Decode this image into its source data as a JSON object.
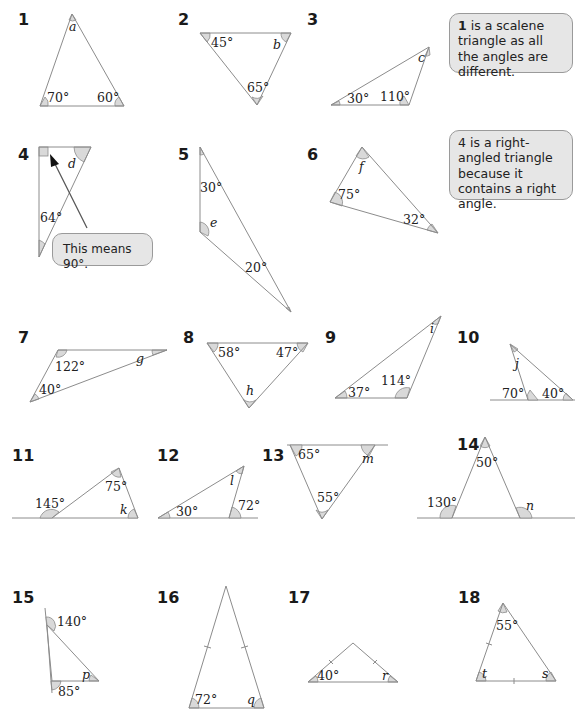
{
  "exercise": {
    "questions": [
      {
        "number": "1",
        "known": [
          "70°",
          "60°"
        ],
        "unknown": "a"
      },
      {
        "number": "2",
        "known": [
          "45°",
          "65°"
        ],
        "unknown": "b"
      },
      {
        "number": "3",
        "known": [
          "30°",
          "110°"
        ],
        "unknown": "c"
      },
      {
        "number": "4",
        "known": [
          "64°"
        ],
        "unknown": "d",
        "right_angle": true
      },
      {
        "number": "5",
        "known": [
          "30°",
          "20°"
        ],
        "unknown": "e"
      },
      {
        "number": "6",
        "known": [
          "75°",
          "32°"
        ],
        "unknown": "f"
      },
      {
        "number": "7",
        "known": [
          "122°",
          "40°"
        ],
        "unknown": "g"
      },
      {
        "number": "8",
        "known": [
          "58°",
          "47°"
        ],
        "unknown": "h"
      },
      {
        "number": "9",
        "known": [
          "37°",
          "114°"
        ],
        "unknown": "i"
      },
      {
        "number": "10",
        "known": [
          "70°",
          "40°"
        ],
        "unknown": "j"
      },
      {
        "number": "11",
        "known": [
          "145°",
          "75°"
        ],
        "unknown": "k"
      },
      {
        "number": "12",
        "known": [
          "30°",
          "72°"
        ],
        "unknown": "l"
      },
      {
        "number": "13",
        "known": [
          "65°",
          "55°"
        ],
        "unknown": "m"
      },
      {
        "number": "14",
        "known": [
          "50°",
          "130°"
        ],
        "unknown": "n"
      },
      {
        "number": "15",
        "known": [
          "140°",
          "85°"
        ],
        "unknown": "p"
      },
      {
        "number": "16",
        "known": [
          "72°"
        ],
        "unknown": "q",
        "isosceles": true
      },
      {
        "number": "17",
        "known": [
          "40°"
        ],
        "unknown": "r",
        "isosceles": true
      },
      {
        "number": "18",
        "known": [
          "55°"
        ],
        "unknown": [
          "t",
          "s"
        ],
        "isosceles": true
      }
    ]
  },
  "callouts": {
    "scalene": {
      "bold": "1",
      "text": " is a scalene triangle as all the angles are different."
    },
    "right_angled": {
      "text": "4 is a right-angled triangle because it contains a right angle."
    },
    "means_90": {
      "text": "This means 90°."
    }
  },
  "colors": {
    "line": "#8c8c8c",
    "angle_fill": "#d9d9d9",
    "callout_fill": "#e6e6e6",
    "text": "#222222"
  }
}
